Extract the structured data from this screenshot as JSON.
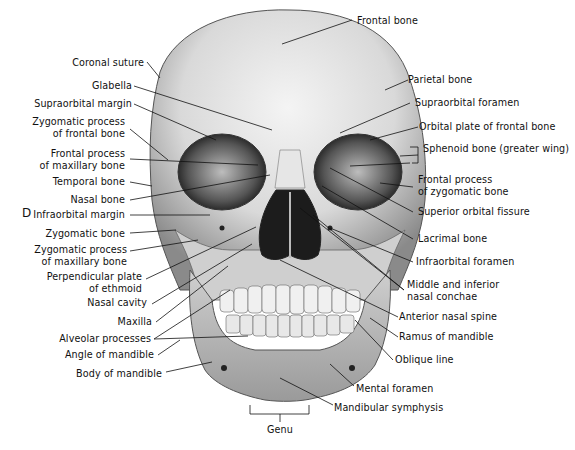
{
  "figure": {
    "panel_letter": "D",
    "labels_left": [
      "Coronal suture",
      "Glabella",
      "Supraorbital margin",
      "Zygomatic process\nof frontal bone",
      "Frontal process\nof maxillary bone",
      "Temporal bone",
      "Nasal bone",
      "Infraorbital margin",
      "Zygomatic bone",
      "Zygomatic process\nof maxillary bone",
      "Perpendicular plate\nof ethmoid",
      "Nasal cavity",
      "Maxilla",
      "Alveolar processes",
      "Angle of mandible",
      "Body of mandible"
    ],
    "labels_right": [
      "Frontal bone",
      "Parietal bone",
      "Supraorbital foramen",
      "Orbital plate of frontal bone",
      "Sphenoid bone (greater wing)",
      "Frontal process\nof zygomatic bone",
      "Superior orbital fissure",
      "Lacrimal bone",
      "Infraorbital foramen",
      "Middle and inferior\nnasal conchae",
      "Anterior nasal spine",
      "Ramus of mandible",
      "Oblique line",
      "Mental foramen",
      "Mandibular symphysis"
    ],
    "labels_bottom": [
      "Genu"
    ]
  }
}
